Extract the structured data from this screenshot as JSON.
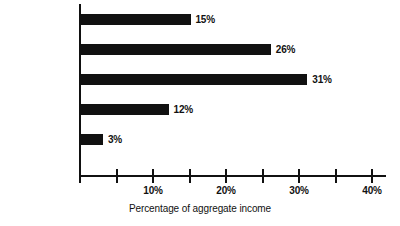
{
  "chart_data": {
    "type": "bar",
    "orientation": "horizontal",
    "title": "",
    "xlabel": "Percentage of aggregate income",
    "ylabel": "",
    "categories": [
      "$8,000 or more",
      "$5,000-7,999",
      "$2,000-4,999",
      "Less than $2,000",
      "No answer, etc."
    ],
    "values": [
      15,
      26,
      31,
      12,
      3
    ],
    "value_labels": [
      "15%",
      "26%",
      "31%",
      "12%",
      "3%"
    ],
    "xlim": [
      0,
      40
    ],
    "xticks": [
      0,
      5,
      10,
      15,
      20,
      25,
      30,
      35,
      40
    ],
    "xtick_labels": [
      "",
      "",
      "10%",
      "",
      "20%",
      "",
      "30%",
      "",
      "40%"
    ],
    "grid": false,
    "legend": false,
    "bar_color": "#111111",
    "axis_color": "#111111"
  }
}
